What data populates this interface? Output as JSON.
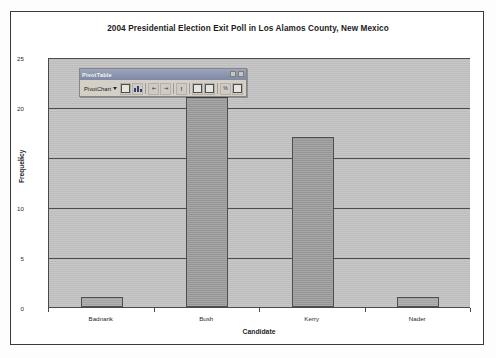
{
  "chart_data": {
    "type": "bar",
    "title": "2004 Presidential Election Exit Poll in Los Alamos County, New Mexico",
    "categories": [
      "Badnarik",
      "Bush",
      "Kerry",
      "Nader"
    ],
    "values": [
      1,
      21,
      17,
      1
    ],
    "xlabel": "Candidate",
    "ylabel": "Frequency",
    "ylim": [
      0,
      25
    ],
    "yticks": [
      0,
      5,
      10,
      15,
      20,
      25
    ],
    "grid": true,
    "legend": "none",
    "colors": {
      "plot_background": "#c2c2c2",
      "bar_fill": "#a8a8a8",
      "bar_border": "#4f4f4f",
      "gridline": "#4e4e4e",
      "axis": "#4a4a4a",
      "text": "#1c1c1c",
      "figure_border": "#3a3a3a"
    }
  },
  "pivot_toolbar": {
    "title": "PivotTable",
    "menu_label": "PivotChart",
    "window_buttons": [
      "minimize-button",
      "close-button"
    ],
    "buttons": [
      {
        "name": "field-list-button",
        "icon": "field-list-icon"
      },
      {
        "name": "chart-wizard-button",
        "icon": "chart-icon"
      },
      {
        "name": "hide-detail-button",
        "icon": "hide-detail-icon"
      },
      {
        "name": "show-detail-button",
        "icon": "show-detail-icon"
      },
      {
        "name": "refresh-data-button",
        "icon": "exclamation-icon"
      },
      {
        "name": "include-hidden-items-button",
        "icon": "table-icon"
      },
      {
        "name": "always-display-items-button",
        "icon": "grid-icon"
      },
      {
        "name": "field-settings-button",
        "icon": "field-settings-icon"
      },
      {
        "name": "hide-field-list-button",
        "icon": "list-icon"
      }
    ]
  }
}
